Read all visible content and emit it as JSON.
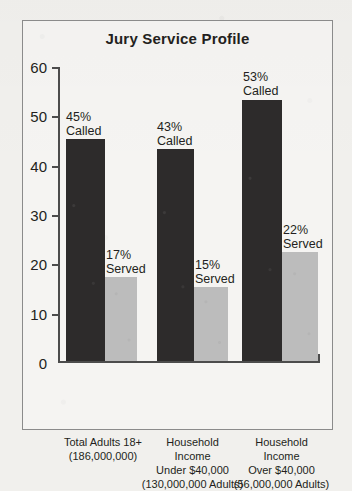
{
  "chart": {
    "title": "Jury Service Profile"
  },
  "axis": {
    "y_ticks": [
      "60",
      "50",
      "40",
      "30",
      "20",
      "10",
      "0"
    ]
  },
  "colors": {
    "called_bar": "#2d2b2b",
    "served_bar": "#bcbcbc",
    "axis": "#4c4c4c",
    "frame": "#8b8b8b",
    "paper": "#f1f0ed"
  },
  "groups": [
    {
      "label_lines": [
        "Total Adults 18+",
        "(186,000,000)"
      ],
      "called": {
        "value": 45,
        "pct_label": "45%",
        "kind_label": "Called"
      },
      "served": {
        "value": 17,
        "pct_label": "17%",
        "kind_label": "Served"
      }
    },
    {
      "label_lines": [
        "Household",
        "Income",
        "Under $40,000",
        "(130,000,000 Adults)"
      ],
      "called": {
        "value": 43,
        "pct_label": "43%",
        "kind_label": "Called"
      },
      "served": {
        "value": 15,
        "pct_label": "15%",
        "kind_label": "Served"
      }
    },
    {
      "label_lines": [
        "Household",
        "Income",
        "Over $40,000",
        "(56,000,000 Adults)"
      ],
      "called": {
        "value": 53,
        "pct_label": "53%",
        "kind_label": "Called"
      },
      "served": {
        "value": 22,
        "pct_label": "22%",
        "kind_label": "Served"
      }
    }
  ],
  "chart_data": {
    "type": "bar",
    "title": "Jury Service Profile",
    "xlabel": "",
    "ylabel": "",
    "ylim": [
      0,
      60
    ],
    "yticks": [
      0,
      10,
      20,
      30,
      40,
      50,
      60
    ],
    "grid": false,
    "legend": "none",
    "categories": [
      "Total Adults 18+ (186,000,000)",
      "Household Income Under $40,000 (130,000,000 Adults)",
      "Household Income Over $40,000 (56,000,000 Adults)"
    ],
    "series": [
      {
        "name": "Called",
        "values": [
          45,
          43,
          53
        ]
      },
      {
        "name": "Served",
        "values": [
          17,
          15,
          22
        ]
      }
    ],
    "annotations": [
      "45% Called",
      "17% Served",
      "43% Called",
      "15% Served",
      "53% Called",
      "22% Served"
    ]
  }
}
